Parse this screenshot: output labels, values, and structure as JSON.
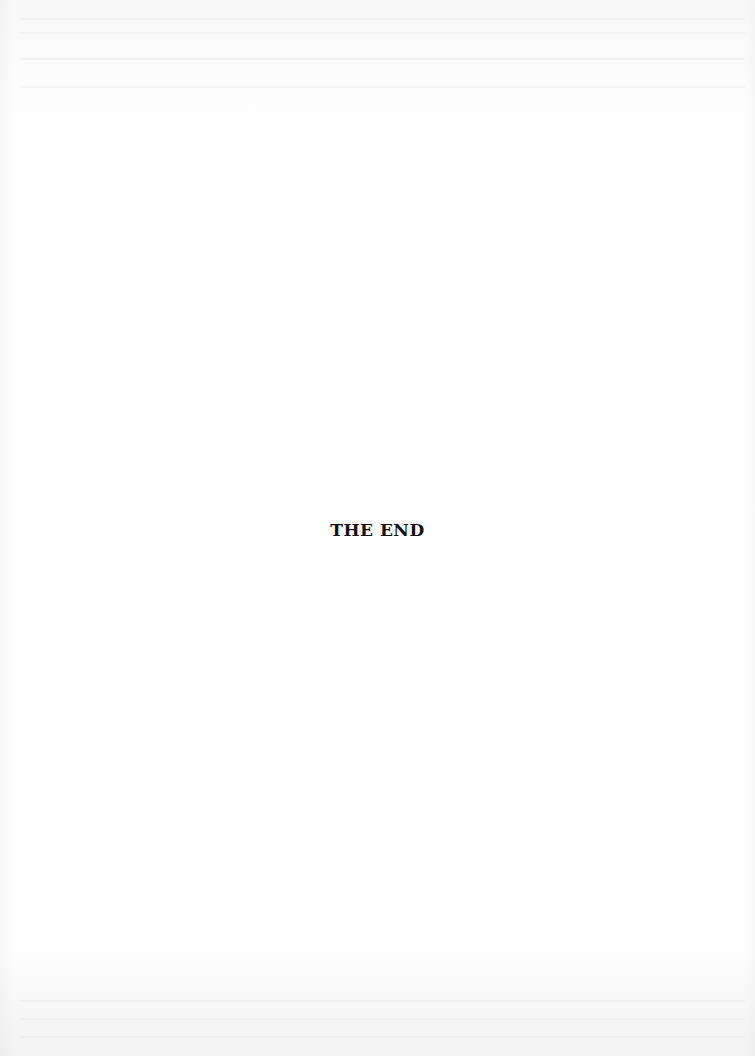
{
  "page": {
    "closing_text": "THE END",
    "background_color": "#fefefe",
    "text_color": "#111111"
  }
}
